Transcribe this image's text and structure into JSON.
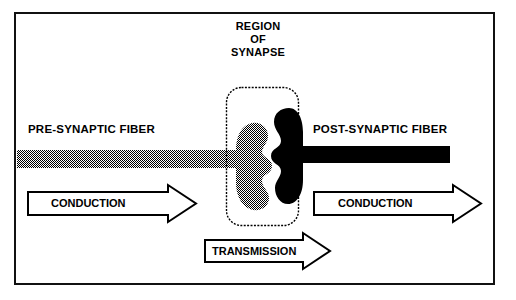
{
  "figure": {
    "title_lines": [
      "REGION",
      "OF",
      "SYNAPSE"
    ],
    "labels": {
      "pre_fiber": "PRE-SYNAPTIC FIBER",
      "post_fiber": "POST-SYNAPTIC FIBER"
    },
    "arrows": [
      {
        "name": "conduction-left",
        "label": "CONDUCTION",
        "direction": "right"
      },
      {
        "name": "conduction-right",
        "label": "CONDUCTION",
        "direction": "right"
      },
      {
        "name": "transmission",
        "label": "TRANSMISSION",
        "direction": "right"
      }
    ],
    "colors": {
      "ink": "#000000",
      "background": "#ffffff",
      "frame": "#111111",
      "presynaptic_fill": "#808080",
      "postsynaptic_fill": "#000000"
    },
    "elements": {
      "synapse_region_box": "rounded-rectangle-dashed",
      "presynaptic_terminal": "gray-dithered-bouton",
      "postsynaptic_terminal": "black-bouton"
    }
  }
}
